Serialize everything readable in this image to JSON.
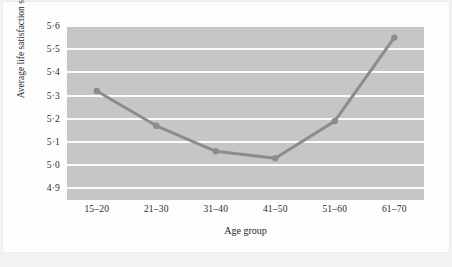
{
  "chart_data": {
    "type": "line",
    "title": "",
    "xlabel": "Age group",
    "ylabel": "Average life satisfaction score",
    "categories": [
      "15–20",
      "21–30",
      "31–40",
      "41–50",
      "51–60",
      "61–70"
    ],
    "values": [
      5.32,
      5.17,
      5.06,
      5.03,
      5.19,
      5.55
    ],
    "series": [
      {
        "name": "Average life satisfaction score",
        "values": [
          5.32,
          5.17,
          5.06,
          5.03,
          5.19,
          5.55
        ]
      }
    ],
    "ylim": [
      4.85,
      5.6
    ],
    "yticks": [
      4.9,
      5.0,
      5.1,
      5.2,
      5.3,
      5.4,
      5.5,
      5.6
    ],
    "ytick_labels": [
      "4·9",
      "5·0",
      "5·1",
      "5·2",
      "5·3",
      "5·4",
      "5·5",
      "5·6"
    ],
    "grid": "horizontal",
    "legend": "none",
    "colors": {
      "plot_background": "#c6c6c6",
      "gridline": "#fbfbfb",
      "line": "#8c8c8c",
      "marker": "#8c8c8c",
      "figure_background": "#fdfdfd",
      "page_background": "#f2f2f2",
      "text": "#1f1f1f"
    }
  }
}
